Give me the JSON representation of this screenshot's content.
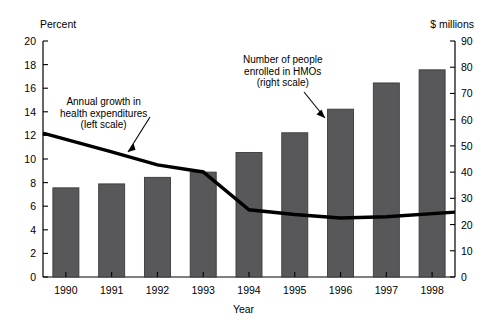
{
  "chart_data": {
    "type": "bar",
    "title": "",
    "categories": [
      "1990",
      "1991",
      "1992",
      "1993",
      "1994",
      "1995",
      "1996",
      "1997",
      "1998"
    ],
    "xlabel": "Year",
    "grid": false,
    "legend_position": "inline-annotations",
    "series": [
      {
        "name": "Number of people enrolled in HMOs",
        "type": "bar",
        "axis": "right",
        "unit": "$ millions",
        "values": [
          34,
          35.5,
          38,
          40,
          47.5,
          55,
          64,
          74,
          79
        ],
        "color": "#58585a"
      },
      {
        "name": "Annual growth in health expenditures",
        "type": "line",
        "axis": "left",
        "unit": "Percent",
        "values": [
          12.2,
          10.6,
          9.5,
          8.9,
          5.7,
          5.3,
          5.0,
          5.1,
          5.5
        ],
        "color": "#000000"
      }
    ],
    "left_axis": {
      "label": "Percent",
      "ylim": [
        0,
        20
      ],
      "ticks": [
        0,
        2,
        4,
        6,
        8,
        10,
        12,
        14,
        16,
        18,
        20
      ],
      "tick_labels": [
        "0",
        "2",
        "4",
        "6",
        "8",
        "10",
        "12",
        "14",
        "16",
        "18",
        "20"
      ]
    },
    "right_axis": {
      "label": "$ millions",
      "ylim": [
        0,
        90
      ],
      "ticks": [
        0,
        10,
        20,
        30,
        40,
        50,
        60,
        70,
        80,
        90
      ],
      "tick_labels": [
        "0",
        "10",
        "20",
        "30",
        "40",
        "50",
        "60",
        "70",
        "80",
        "90"
      ]
    },
    "annotations": [
      {
        "name": "line-annotation",
        "lines": [
          "Annual growth in",
          "health expenditures",
          "(left scale)"
        ],
        "text": "Annual growth in\nhealth expenditures\n(left scale)"
      },
      {
        "name": "bar-annotation",
        "lines": [
          "Number of people",
          "enrolled in HMOs",
          "(right scale)"
        ],
        "text": "Number of people\nenrolled in HMOs\n(right scale)"
      }
    ]
  },
  "labels": {
    "left_axis_title": "Percent",
    "right_axis_title": "$ millions",
    "x_axis_title": "Year",
    "anno_line_1": "Annual growth in",
    "anno_line_2": "health expenditures",
    "anno_line_3": "(left scale)",
    "anno_bar_1": "Number of people",
    "anno_bar_2": "enrolled in HMOs",
    "anno_bar_3": "(right scale)"
  },
  "colors": {
    "bar_fill": "#58585a",
    "bar_stroke": "#3a3a3c",
    "line": "#000000",
    "axis": "#000000",
    "background": "#ffffff"
  }
}
